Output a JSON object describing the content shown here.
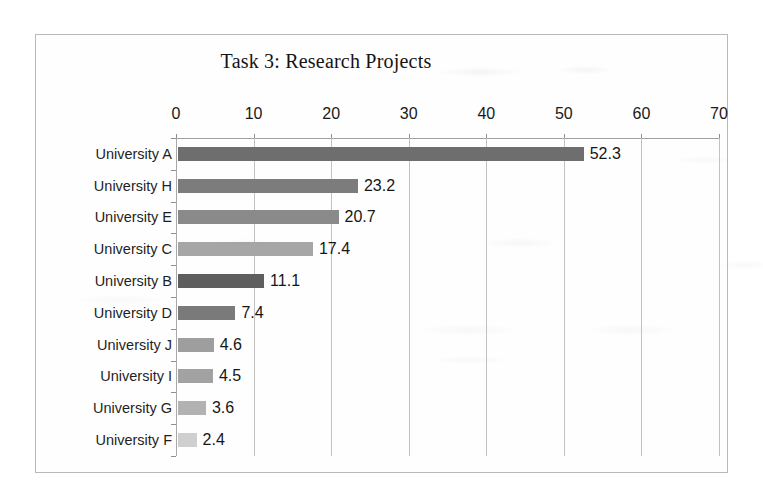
{
  "chart_data": {
    "type": "bar",
    "orientation": "horizontal",
    "title": "Task 3: Research Projects",
    "xlabel": "",
    "ylabel": "",
    "categories": [
      "University A",
      "University H",
      "University E",
      "University C",
      "University B",
      "University D",
      "University J",
      "University I",
      "University G",
      "University F"
    ],
    "values": [
      52.3,
      23.2,
      20.7,
      17.4,
      11.1,
      7.4,
      4.6,
      4.5,
      3.6,
      2.4
    ],
    "value_labels": [
      "52.3",
      "23.2",
      "20.7",
      "17.4",
      "11.1",
      "7.4",
      "4.6",
      "4.5",
      "3.6",
      "2.4"
    ],
    "bar_colors": [
      "#6e6e6e",
      "#7c7c7c",
      "#8a8a8a",
      "#a6a6a6",
      "#5e5e5e",
      "#7a7a7a",
      "#9e9e9e",
      "#a2a2a2",
      "#b2b2b2",
      "#cfcfcf"
    ],
    "xlim": [
      0,
      70
    ],
    "xticks": [
      0,
      10,
      20,
      30,
      40,
      50,
      60,
      70
    ],
    "xtick_labels": [
      "0",
      "10",
      "20",
      "30",
      "40",
      "50",
      "60",
      "70"
    ],
    "grid": true,
    "grid_axis": "x",
    "legend": false,
    "data_labels": true,
    "value_axis_position": "top"
  }
}
